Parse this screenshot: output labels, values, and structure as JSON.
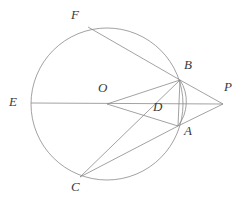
{
  "figure": {
    "type": "geometry-diagram",
    "width": 244,
    "height": 209,
    "background_color": "#ffffff",
    "stroke_color": "#8a8a8a",
    "label_color": "#3a3a3a",
    "stroke_width": 0.8
  },
  "circle": {
    "name": "main-circle",
    "center": {
      "x": 107,
      "y": 104
    },
    "radius": 76
  },
  "arc": {
    "name": "arc-b-a",
    "from": {
      "x": 180,
      "y": 80
    },
    "to": {
      "x": 178,
      "y": 126
    },
    "radius": 40,
    "sweep": 1,
    "large_arc": 0
  },
  "points": [
    {
      "id": "E",
      "label": "E",
      "x": 31,
      "y": 103,
      "label_x": 9,
      "label_y": 95,
      "on_circle": true
    },
    {
      "id": "F",
      "label": "F",
      "x": 88,
      "y": 27,
      "label_x": 71,
      "label_y": 8,
      "on_circle": true
    },
    {
      "id": "O",
      "label": "O",
      "x": 107,
      "y": 104,
      "label_x": 98,
      "label_y": 81,
      "on_circle": false
    },
    {
      "id": "B",
      "label": "B",
      "x": 180,
      "y": 80,
      "label_x": 184,
      "label_y": 58,
      "on_circle": true
    },
    {
      "id": "D",
      "label": "D",
      "x": 167,
      "y": 104,
      "label_x": 153,
      "label_y": 100,
      "on_circle": false
    },
    {
      "id": "A",
      "label": "A",
      "x": 178,
      "y": 126,
      "label_x": 184,
      "label_y": 124,
      "on_circle": true
    },
    {
      "id": "P",
      "label": "P",
      "x": 223,
      "y": 104,
      "label_x": 224,
      "label_y": 80,
      "on_circle": false
    },
    {
      "id": "C",
      "label": "C",
      "x": 80,
      "y": 177,
      "label_x": 71,
      "label_y": 180,
      "on_circle": true
    }
  ],
  "segments": [
    {
      "name": "segment-e-p",
      "from": "E",
      "to": "P",
      "x1": 31,
      "y1": 103,
      "x2": 223,
      "y2": 104
    },
    {
      "name": "segment-f-b",
      "from": "F",
      "to": "B",
      "x1": 88,
      "y1": 27,
      "x2": 180,
      "y2": 80
    },
    {
      "name": "segment-o-b",
      "from": "O",
      "to": "B",
      "x1": 107,
      "y1": 104,
      "x2": 180,
      "y2": 80
    },
    {
      "name": "segment-o-a",
      "from": "O",
      "to": "A",
      "x1": 107,
      "y1": 104,
      "x2": 178,
      "y2": 126
    },
    {
      "name": "segment-b-p",
      "from": "B",
      "to": "P",
      "x1": 180,
      "y1": 80,
      "x2": 223,
      "y2": 104
    },
    {
      "name": "segment-a-p",
      "from": "A",
      "to": "P",
      "x1": 178,
      "y1": 126,
      "x2": 223,
      "y2": 104
    },
    {
      "name": "segment-b-a",
      "from": "B",
      "to": "A",
      "x1": 180,
      "y1": 80,
      "x2": 178,
      "y2": 126
    },
    {
      "name": "segment-c-b",
      "from": "C",
      "to": "B",
      "x1": 80,
      "y1": 177,
      "x2": 180,
      "y2": 80
    },
    {
      "name": "segment-c-a",
      "from": "C",
      "to": "A",
      "x1": 80,
      "y1": 177,
      "x2": 178,
      "y2": 126
    }
  ]
}
